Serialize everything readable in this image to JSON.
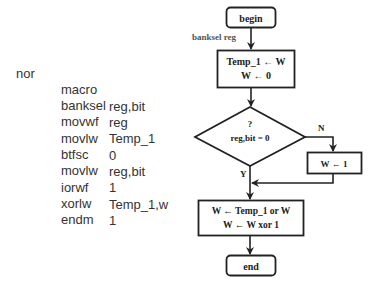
{
  "code": {
    "label": "nor",
    "lines": [
      {
        "mnemonic": "macro",
        "operand": "reg,bit"
      },
      {
        "mnemonic": "banksel",
        "operand": "reg"
      },
      {
        "mnemonic": "movwf",
        "operand": "Temp_1"
      },
      {
        "mnemonic": "movlw",
        "operand": "0"
      },
      {
        "mnemonic": "btfsc",
        "operand": "reg,bit"
      },
      {
        "mnemonic": "movlw",
        "operand": "1"
      },
      {
        "mnemonic": "iorwf",
        "operand": "Temp_1,w"
      },
      {
        "mnemonic": "xorlw",
        "operand": "1"
      },
      {
        "mnemonic": "endm",
        "operand": ""
      }
    ]
  },
  "flowchart": {
    "begin": "begin",
    "banksel_label": "banksel reg",
    "process1": {
      "line1": "Temp_1 ← W",
      "line2": "W ← 0"
    },
    "decision": {
      "line1": "?",
      "line2": "reg,bit = 0"
    },
    "no_label": "N",
    "yes_label": "Y",
    "set_one": "W ← 1",
    "process2": {
      "line1": "W ← Temp_1 or W",
      "line2": "W ← W xor 1"
    },
    "end": "end"
  },
  "colors": {
    "stroke": "#222222",
    "text": "#333333",
    "background": "#ffffff"
  }
}
